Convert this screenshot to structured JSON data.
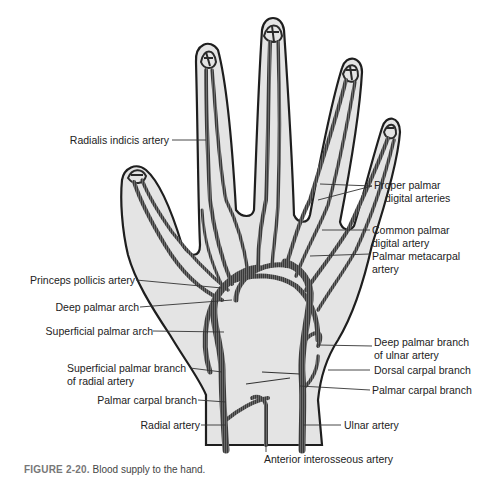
{
  "figure": {
    "number": "FIGURE 2-20.",
    "caption": "Blood supply to the hand."
  },
  "colors": {
    "skin_fill": "#e4e4e4",
    "outline": "#1e1e1e",
    "artery": "#3a3a3a",
    "leader": "#333333",
    "caption_number": "#7a7a7a"
  },
  "labels": {
    "radialis_indicis": "Radialis indicis artery",
    "proper_palmar_digital_1": "Proper palmar",
    "proper_palmar_digital_2": "digital arteries",
    "common_palmar_digital_1": "Common palmar",
    "common_palmar_digital_2": "digital artery",
    "palmar_metacarpal_1": "Palmar metacarpal",
    "palmar_metacarpal_2": "artery",
    "princeps_pollicis": "Princeps pollicis artery",
    "deep_palmar_arch": "Deep palmar arch",
    "superficial_palmar_arch": "Superficial palmar arch",
    "deep_palmar_branch_ulnar_1": "Deep palmar branch",
    "deep_palmar_branch_ulnar_2": "of ulnar artery",
    "superficial_palmar_branch_radial_1": "Superficial palmar branch",
    "superficial_palmar_branch_radial_2": "of radial artery",
    "dorsal_carpal_branch": "Dorsal carpal branch",
    "palmar_carpal_branch_right": "Palmar carpal branch",
    "palmar_carpal_branch_left": "Palmar carpal branch",
    "radial_artery": "Radial artery",
    "ulnar_artery": "Ulnar artery",
    "anterior_interosseous": "Anterior interosseous artery"
  }
}
